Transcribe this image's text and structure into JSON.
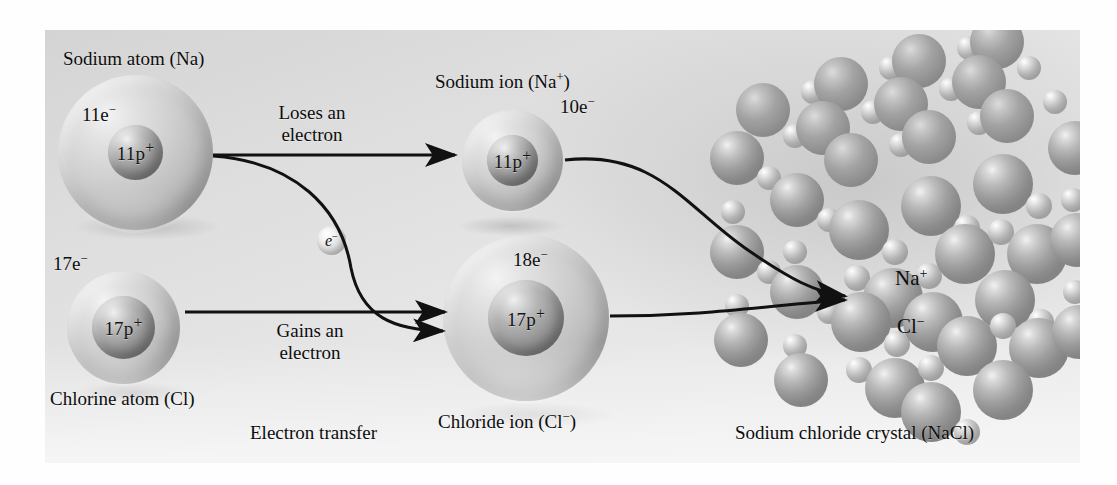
{
  "figure": {
    "background_color": "#fefefe",
    "panel_color": "#e0e0e0",
    "caption_left": "Electron transfer",
    "caption_right": "Sodium chloride crystal (NaCl)"
  },
  "sodium_atom": {
    "title": "Sodium atom (Na)",
    "electrons": "11e",
    "electron_charge": "−",
    "protons": "11p",
    "proton_charge": "+"
  },
  "chlorine_atom": {
    "title": "Chlorine atom (Cl)",
    "electrons": "17e",
    "electron_charge": "−",
    "protons": "17p",
    "proton_charge": "+"
  },
  "sodium_ion": {
    "title_base": "Sodium ion (Na",
    "title_charge": "+",
    "title_close": ")",
    "electrons": "10e",
    "electron_charge": "−",
    "protons": "11p",
    "proton_charge": "+"
  },
  "chloride_ion": {
    "title_base": "Chloride ion (Cl",
    "title_charge": "−",
    "title_close": ")",
    "electrons": "18e",
    "electron_charge": "−",
    "protons": "17p",
    "proton_charge": "+"
  },
  "transfer": {
    "loses_line1": "Loses an",
    "loses_line2": "electron",
    "gains_line1": "Gains an",
    "gains_line2": "electron",
    "electron_symbol": "e",
    "electron_charge": "−"
  },
  "crystal": {
    "label_cation": "Na",
    "label_cation_charge": "+",
    "label_anion": "Cl",
    "label_anion_charge": "−"
  }
}
